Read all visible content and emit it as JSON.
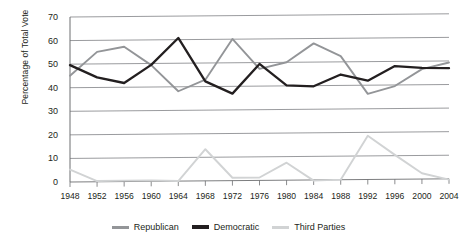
{
  "chart_data": {
    "type": "line",
    "title": "",
    "subtitle": "",
    "xlabel": "",
    "ylabel": "Percentage of Total Vote",
    "categories": [
      "1948",
      "1952",
      "1956",
      "1960",
      "1964",
      "1968",
      "1972",
      "1976",
      "1980",
      "1984",
      "1988",
      "1992",
      "1996",
      "2000",
      "2004"
    ],
    "x": [
      1948,
      1952,
      1956,
      1960,
      1964,
      1968,
      1972,
      1976,
      1980,
      1984,
      1988,
      1992,
      1996,
      2000,
      2004
    ],
    "series": [
      {
        "name": "Republican",
        "color": "#939598",
        "values": [
          45.1,
          55.2,
          57.4,
          49.6,
          38.5,
          43.4,
          60.7,
          48.0,
          50.8,
          58.8,
          53.4,
          37.4,
          40.7,
          47.9,
          50.7
        ]
      },
      {
        "name": "Democratic",
        "color": "#231f20",
        "values": [
          49.6,
          44.4,
          42.0,
          49.7,
          61.1,
          42.7,
          37.5,
          50.1,
          41.0,
          40.6,
          45.6,
          43.0,
          49.2,
          48.4,
          48.3
        ]
      },
      {
        "name": "Third Parties",
        "color": "#d1d3d4",
        "values": [
          5.3,
          0.4,
          0.6,
          0.7,
          0.4,
          13.9,
          1.8,
          1.9,
          8.2,
          0.6,
          1.0,
          19.6,
          11.5,
          3.7,
          1.0
        ]
      }
    ],
    "ylim": [
      0,
      70
    ],
    "yticks": [
      0,
      10,
      20,
      30,
      40,
      50,
      60,
      70
    ],
    "grid": true,
    "grid_axis": "y",
    "legend_position": "bottom",
    "annotations": []
  },
  "legend": {
    "items": [
      {
        "label": "Republican",
        "color": "#939598"
      },
      {
        "label": "Democratic",
        "color": "#231f20"
      },
      {
        "label": "Third Parties",
        "color": "#d1d3d4"
      }
    ]
  },
  "axes": {
    "y_axis_title": "Percentage of Total Vote",
    "y_tick_labels": [
      "70",
      "60",
      "50",
      "40",
      "30",
      "20",
      "10",
      "0"
    ],
    "x_tick_labels": [
      "1948",
      "1952",
      "1956",
      "1960",
      "1964",
      "1968",
      "1972",
      "1976",
      "1980",
      "1984",
      "1988",
      "1992",
      "1996",
      "2000",
      "2004"
    ]
  },
  "colors": {
    "republican": "#939598",
    "democratic": "#231f20",
    "third_parties": "#d1d3d4",
    "gridline": "#808285",
    "axis": "#6d6e71",
    "text": "#231f20",
    "background": "#ffffff"
  }
}
